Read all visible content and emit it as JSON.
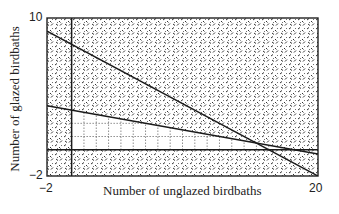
{
  "chart_data": {
    "type": "line",
    "title": "",
    "xlabel": "Number of unglazed birdbaths",
    "ylabel": "Number of glazed birdbaths",
    "xlim": [
      -2,
      20
    ],
    "ylim": [
      -2,
      10
    ],
    "x_ticks": [
      "-2",
      "20"
    ],
    "y_ticks": [
      "10",
      "-2"
    ],
    "grid": false,
    "legend": null,
    "series": [
      {
        "name": "constraint x + 2y = 16",
        "x": [
          -2,
          20
        ],
        "y": [
          9,
          -2
        ]
      },
      {
        "name": "constraint x + 6y = 18",
        "x": [
          -2,
          20
        ],
        "y": [
          3.33,
          -0.33
        ]
      },
      {
        "name": "x = 0 axis",
        "x": [
          0,
          0
        ],
        "y": [
          -2,
          10
        ]
      },
      {
        "name": "y = 0 axis",
        "x": [
          -2,
          20
        ],
        "y": [
          0,
          0
        ]
      }
    ],
    "feasible_region": {
      "description": "unshaded dotted region bounded by x >= 0, y >= 0, x + 6y <= 18",
      "vertices": [
        [
          0,
          0
        ],
        [
          18,
          0
        ],
        [
          0,
          3
        ]
      ]
    },
    "shading": "textured hatch pattern outside the feasible region"
  },
  "labels": {
    "x_min": "−2",
    "x_max": "20",
    "y_max": "10",
    "y_min": "−2",
    "x_title": "Number of unglazed birdbaths",
    "y_title": "Number of glazed birdbaths"
  }
}
